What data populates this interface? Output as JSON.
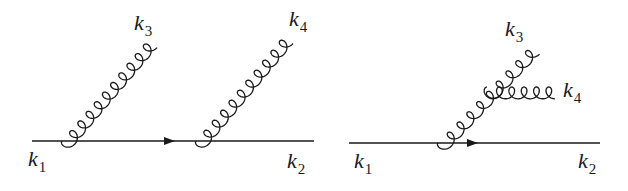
{
  "figure": {
    "diagrams": [
      {
        "id": "left",
        "description": "Quark line emitting two separate gluons",
        "line": {
          "x1": 32,
          "y": 141,
          "x2": 314,
          "arrow_x": 172
        },
        "gluons": [
          {
            "from": [
              62,
              141
            ],
            "to": [
              148,
              40
            ],
            "loops": 10,
            "label": {
              "base": "k",
              "sub": "3",
              "x": 134,
              "y": 30
            }
          },
          {
            "from": [
              196,
              141
            ],
            "to": [
              284,
              36
            ],
            "loops": 10,
            "label": {
              "base": "k",
              "sub": "4",
              "x": 289,
              "y": 26
            }
          }
        ],
        "labels": {
          "k1": {
            "base": "k",
            "sub": "1",
            "x": 28,
            "y": 166
          },
          "k2": {
            "base": "k",
            "sub": "2",
            "x": 287,
            "y": 168
          }
        }
      },
      {
        "id": "right",
        "description": "Quark line emitting a gluon that splits into two gluons",
        "line": {
          "x1": 349,
          "y": 143,
          "x2": 600,
          "arrow_x": 475
        },
        "gluons": [
          {
            "from": [
              438,
              143
            ],
            "to": [
              531,
              46
            ],
            "loops": 9,
            "label": {
              "base": "k",
              "sub": "3",
              "x": 505,
              "y": 36
            }
          },
          {
            "from": [
              487,
              87
            ],
            "to": [
              555,
              87
            ],
            "loops": 5,
            "label": {
              "base": "k",
              "sub": "4",
              "x": 563,
              "y": 97
            }
          }
        ],
        "labels": {
          "k1": {
            "base": "k",
            "sub": "1",
            "x": 354,
            "y": 168
          },
          "k2": {
            "base": "k",
            "sub": "2",
            "x": 578,
            "y": 168
          }
        }
      }
    ],
    "stroke_color": "#1a1a1a"
  }
}
